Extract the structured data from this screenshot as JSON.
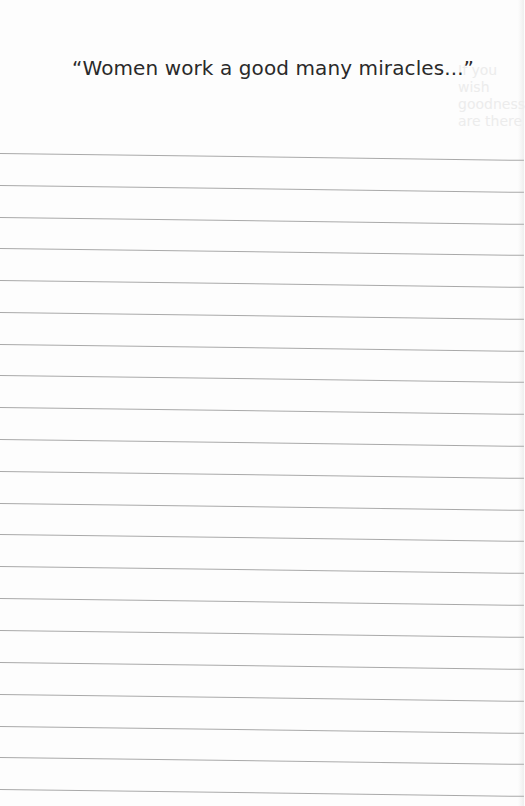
{
  "page": {
    "quote": "“Women work a good many miracles...”",
    "bleed_through_lines": [
      "If you wish",
      "goodness",
      "are there",
      "..."
    ],
    "ruled_line_count": 21,
    "ruled_lines_top_px": [
      153,
      185,
      217,
      248,
      280,
      312,
      344,
      375,
      407,
      439,
      471,
      503,
      534,
      566,
      598,
      630,
      662,
      694,
      726,
      757,
      789
    ],
    "colors": {
      "paper": "#fdfdfd",
      "text": "#2a2a2a",
      "rule": "#a9a9a9"
    }
  }
}
